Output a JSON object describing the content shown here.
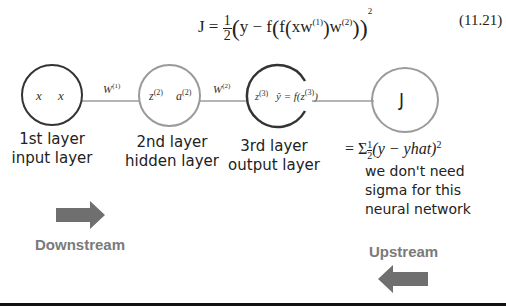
{
  "equation": {
    "lhs": "J",
    "text": "J = ½(y − f(f(xw⁽¹⁾)w⁽²⁾))²",
    "number": "(11.21)"
  },
  "nodes": [
    {
      "id": "input",
      "contents": [
        "x",
        "x"
      ],
      "label_line1": "1st layer",
      "label_line2": "input layer",
      "border_color": "#333333"
    },
    {
      "id": "hidden",
      "contents": [
        "z",
        "a"
      ],
      "superscript": "(2)",
      "label_line1": "2nd layer",
      "label_line2": "hidden layer",
      "border_color": "#9a9a9a"
    },
    {
      "id": "output",
      "contents": [
        "z",
        "ŷ = f(z"
      ],
      "superscript": "(3)",
      "label_line1": "3rd layer",
      "label_line2": "output layer",
      "border_color": "#333333"
    },
    {
      "id": "cost",
      "contents": [
        "J"
      ],
      "border_color": "#9a9a9a"
    }
  ],
  "weights": [
    {
      "symbol": "W",
      "superscript": "(1)"
    },
    {
      "symbol": "W",
      "superscript": "(2)"
    }
  ],
  "cost_formula": "= Σ½(y − yhat)²",
  "note": [
    "we don't need",
    "sigma for this",
    "neural network"
  ],
  "downstream": {
    "label": "Downstream",
    "direction": "right",
    "color": "#7a7a7a"
  },
  "upstream": {
    "label": "Upstream",
    "direction": "left",
    "color": "#7a7a7a"
  }
}
